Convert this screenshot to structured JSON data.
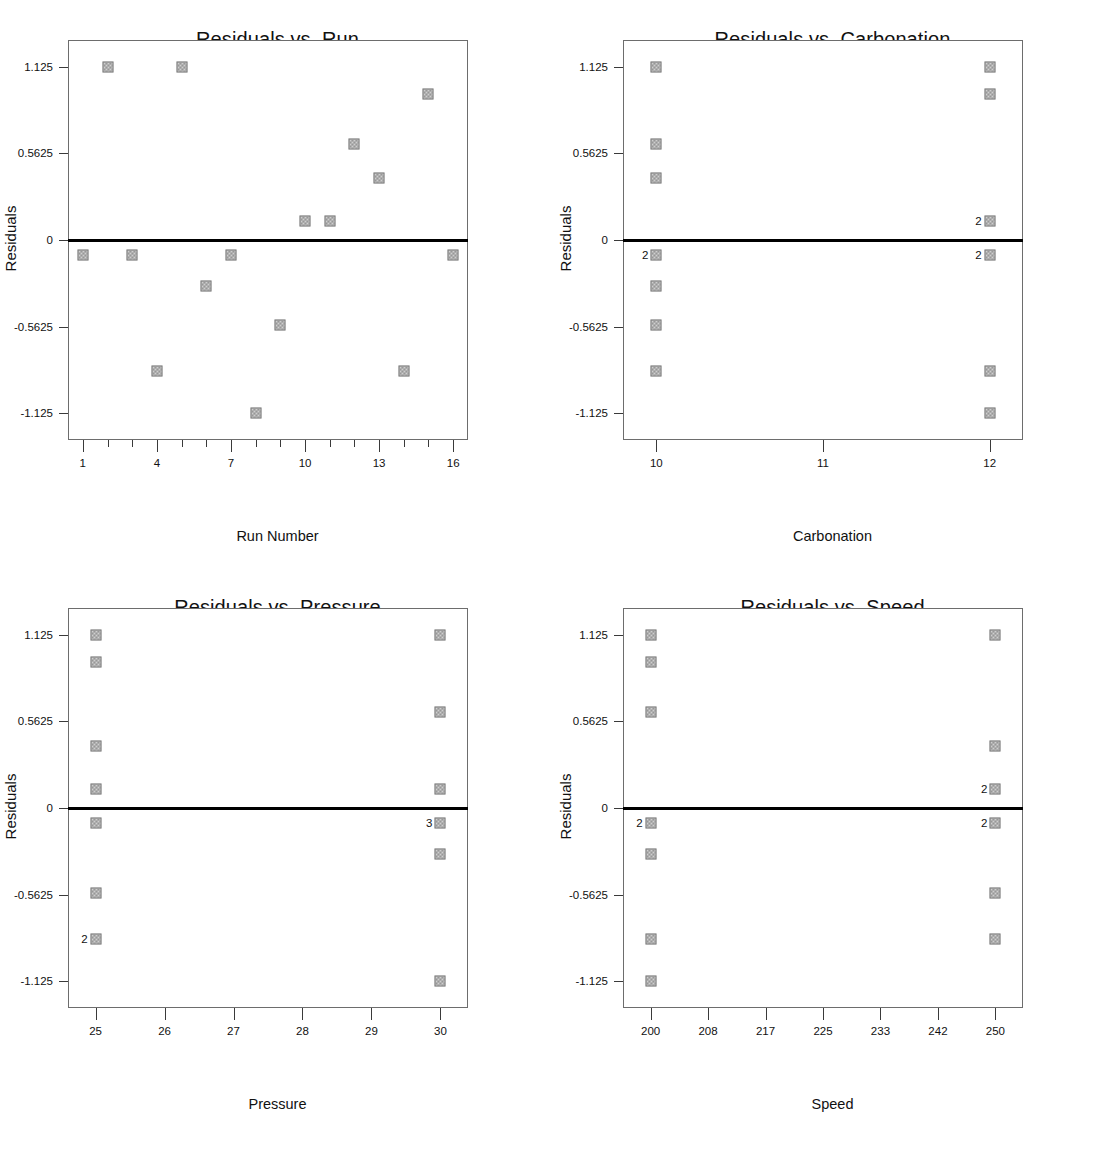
{
  "axis": {
    "y_title": "Residuals",
    "y_ticks": [
      "1.125",
      "0.5625",
      "0",
      "-0.5625",
      "-1.125"
    ],
    "y_tick_values": [
      1.125,
      0.5625,
      0,
      -0.5625,
      -1.125
    ],
    "ylim": [
      -1.3,
      1.3
    ]
  },
  "panels": [
    {
      "id": "run",
      "title": "Residuals vs. Run",
      "xlabel": "Run Number",
      "x_tick_labels": [
        "1",
        "4",
        "7",
        "10",
        "13",
        "16"
      ],
      "x_tick_values": [
        1,
        4,
        7,
        10,
        13,
        16
      ],
      "x_minor_values": [
        2,
        3,
        5,
        6,
        8,
        9,
        11,
        12,
        14,
        15
      ],
      "xlim": [
        0.4,
        16.6
      ]
    },
    {
      "id": "carbonation",
      "title": "Residuals vs. Carbonation",
      "xlabel": "Carbonation",
      "x_tick_labels": [
        "10",
        "11",
        "12"
      ],
      "x_tick_values": [
        10,
        11,
        12
      ],
      "x_minor_values": [],
      "xlim": [
        9.8,
        12.2
      ]
    },
    {
      "id": "pressure",
      "title": "Residuals vs. Pressure",
      "xlabel": "Pressure",
      "x_tick_labels": [
        "25",
        "26",
        "27",
        "28",
        "29",
        "30"
      ],
      "x_tick_values": [
        25,
        26,
        27,
        28,
        29,
        30
      ],
      "x_minor_values": [],
      "xlim": [
        24.6,
        30.4
      ]
    },
    {
      "id": "speed",
      "title": "Residuals vs. Speed",
      "xlabel": "Speed",
      "x_tick_labels": [
        "200",
        "208",
        "217",
        "225",
        "233",
        "242",
        "250"
      ],
      "x_tick_values": [
        200,
        208.33,
        216.67,
        225,
        233.33,
        241.67,
        250
      ],
      "x_minor_values": [],
      "xlim": [
        196,
        254
      ]
    }
  ],
  "chart_data": [
    {
      "type": "scatter",
      "id": "run",
      "title": "Residuals vs. Run",
      "xlabel": "Run Number",
      "ylabel": "Residuals",
      "xlim": [
        0.4,
        16.6
      ],
      "ylim": [
        -1.3,
        1.3
      ],
      "grid": false,
      "legend": "none",
      "reference_line_y": 0,
      "x": [
        1,
        2,
        3,
        4,
        5,
        6,
        7,
        8,
        9,
        10,
        11,
        12,
        13,
        14,
        15,
        16
      ],
      "y": [
        -0.1,
        1.125,
        -0.1,
        -0.85,
        1.125,
        -0.3,
        -0.1,
        -1.125,
        -0.55,
        0.125,
        0.125,
        0.625,
        0.4,
        -0.85,
        0.95,
        -0.1
      ],
      "point_counts": [
        1,
        1,
        1,
        1,
        1,
        1,
        1,
        1,
        1,
        1,
        1,
        1,
        1,
        1,
        1,
        1
      ]
    },
    {
      "type": "scatter",
      "id": "carbonation",
      "title": "Residuals vs. Carbonation",
      "xlabel": "Carbonation",
      "ylabel": "Residuals",
      "xlim": [
        9.8,
        12.2
      ],
      "ylim": [
        -1.3,
        1.3
      ],
      "grid": false,
      "legend": "none",
      "reference_line_y": 0,
      "points": [
        {
          "x": 10,
          "y": 1.125,
          "count": 1
        },
        {
          "x": 10,
          "y": 0.625,
          "count": 1
        },
        {
          "x": 10,
          "y": 0.4,
          "count": 1
        },
        {
          "x": 10,
          "y": -0.1,
          "count": 2
        },
        {
          "x": 10,
          "y": -0.3,
          "count": 1
        },
        {
          "x": 10,
          "y": -0.55,
          "count": 1
        },
        {
          "x": 10,
          "y": -0.85,
          "count": 1
        },
        {
          "x": 12,
          "y": 1.125,
          "count": 1
        },
        {
          "x": 12,
          "y": 0.95,
          "count": 1
        },
        {
          "x": 12,
          "y": 0.125,
          "count": 2
        },
        {
          "x": 12,
          "y": -0.1,
          "count": 2
        },
        {
          "x": 12,
          "y": -0.85,
          "count": 1
        },
        {
          "x": 12,
          "y": -1.125,
          "count": 1
        }
      ]
    },
    {
      "type": "scatter",
      "id": "pressure",
      "title": "Residuals vs. Pressure",
      "xlabel": "Pressure",
      "ylabel": "Residuals",
      "xlim": [
        24.6,
        30.4
      ],
      "ylim": [
        -1.3,
        1.3
      ],
      "grid": false,
      "legend": "none",
      "reference_line_y": 0,
      "points": [
        {
          "x": 25,
          "y": 1.125,
          "count": 1
        },
        {
          "x": 25,
          "y": 0.95,
          "count": 1
        },
        {
          "x": 25,
          "y": 0.4,
          "count": 1
        },
        {
          "x": 25,
          "y": 0.125,
          "count": 1
        },
        {
          "x": 25,
          "y": -0.1,
          "count": 1
        },
        {
          "x": 25,
          "y": -0.55,
          "count": 1
        },
        {
          "x": 25,
          "y": -0.85,
          "count": 2
        },
        {
          "x": 30,
          "y": 1.125,
          "count": 1
        },
        {
          "x": 30,
          "y": 0.625,
          "count": 1
        },
        {
          "x": 30,
          "y": 0.125,
          "count": 1
        },
        {
          "x": 30,
          "y": -0.1,
          "count": 3
        },
        {
          "x": 30,
          "y": -0.3,
          "count": 1
        },
        {
          "x": 30,
          "y": -1.125,
          "count": 1
        }
      ]
    },
    {
      "type": "scatter",
      "id": "speed",
      "title": "Residuals vs. Speed",
      "xlabel": "Speed",
      "ylabel": "Residuals",
      "xlim": [
        196,
        254
      ],
      "ylim": [
        -1.3,
        1.3
      ],
      "grid": false,
      "legend": "none",
      "reference_line_y": 0,
      "points": [
        {
          "x": 200,
          "y": 1.125,
          "count": 1
        },
        {
          "x": 200,
          "y": 0.95,
          "count": 1
        },
        {
          "x": 200,
          "y": 0.625,
          "count": 1
        },
        {
          "x": 200,
          "y": -0.1,
          "count": 2
        },
        {
          "x": 200,
          "y": -0.3,
          "count": 1
        },
        {
          "x": 200,
          "y": -0.85,
          "count": 1
        },
        {
          "x": 200,
          "y": -1.125,
          "count": 1
        },
        {
          "x": 250,
          "y": 1.125,
          "count": 1
        },
        {
          "x": 250,
          "y": 0.4,
          "count": 1
        },
        {
          "x": 250,
          "y": 0.125,
          "count": 2
        },
        {
          "x": 250,
          "y": -0.1,
          "count": 2
        },
        {
          "x": 250,
          "y": -0.55,
          "count": 1
        },
        {
          "x": 250,
          "y": -0.85,
          "count": 1
        }
      ]
    }
  ]
}
